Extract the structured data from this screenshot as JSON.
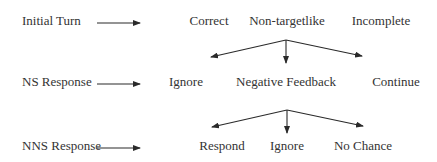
{
  "diagram": {
    "rows": [
      {
        "label": "Initial Turn",
        "outcomes": [
          "Correct",
          "Non-targetlike",
          "Incomplete"
        ]
      },
      {
        "label": "NS Response",
        "outcomes": [
          "Ignore",
          "Negative Feedback",
          "Continue"
        ]
      },
      {
        "label": "NNS Response",
        "outcomes": [
          "Respond",
          "Ignore",
          "No Chance"
        ]
      }
    ],
    "edges": [
      {
        "from": "Initial Turn",
        "to": "Correct"
      },
      {
        "from": "NS Response",
        "to": "Ignore"
      },
      {
        "from": "NNS Response",
        "to": "Respond"
      },
      {
        "from": "Non-targetlike",
        "to": "Ignore"
      },
      {
        "from": "Non-targetlike",
        "to": "Negative Feedback"
      },
      {
        "from": "Non-targetlike",
        "to": "Continue"
      },
      {
        "from": "Negative Feedback",
        "to": "Respond"
      },
      {
        "from": "Negative Feedback",
        "to": "Ignore"
      },
      {
        "from": "Negative Feedback",
        "to": "No Chance"
      }
    ],
    "colors": {
      "text": "#333333",
      "line": "#2a2a2a",
      "background": "#ffffff"
    }
  }
}
